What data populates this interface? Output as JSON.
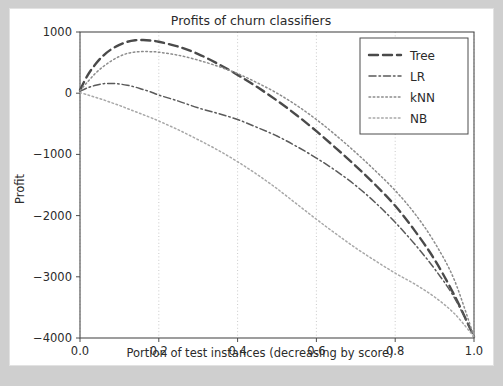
{
  "figure": {
    "background_color": "#ffffff",
    "page_background_color": "#cfcfcf"
  },
  "chart_data": {
    "type": "line",
    "title": "Profits of churn classifiers",
    "xlabel": "Portion of test instances (decreasing by score)",
    "ylabel": "Profit",
    "xlim": [
      0.0,
      1.0
    ],
    "ylim": [
      -4000,
      1000
    ],
    "xticks": [
      0.0,
      0.2,
      0.4,
      0.6,
      0.8,
      1.0
    ],
    "xticklabels": [
      "0.0",
      "0.2",
      "0.4",
      "0.6",
      "0.8",
      "1.0"
    ],
    "yticks": [
      1000,
      0,
      -1000,
      -2000,
      -3000,
      -4000
    ],
    "yticklabels": [
      "1000",
      "0",
      "-1000",
      "-2000",
      "-3000",
      "-4000"
    ],
    "grid": true,
    "grid_axis": "x",
    "legend_position": "upper right",
    "x": [
      0.0,
      0.02,
      0.04,
      0.06,
      0.08,
      0.1,
      0.12,
      0.14,
      0.16,
      0.18,
      0.2,
      0.25,
      0.3,
      0.35,
      0.4,
      0.45,
      0.5,
      0.55,
      0.6,
      0.65,
      0.7,
      0.75,
      0.8,
      0.85,
      0.9,
      0.95,
      1.0
    ],
    "series": [
      {
        "name": "Tree",
        "color": "#4a4a4a",
        "linestyle": "dashed",
        "linewidth": 2.4,
        "dasharray": "9 5",
        "values": [
          50,
          300,
          480,
          620,
          720,
          790,
          840,
          865,
          870,
          860,
          840,
          760,
          640,
          480,
          300,
          100,
          -120,
          -360,
          -620,
          -900,
          -1190,
          -1500,
          -1840,
          -2250,
          -2720,
          -3300,
          -3980
        ]
      },
      {
        "name": "LR",
        "color": "#5a5a5a",
        "linestyle": "dashdot",
        "linewidth": 1.5,
        "dasharray": "7 3 1.5 3",
        "values": [
          30,
          90,
          130,
          155,
          160,
          150,
          130,
          100,
          60,
          20,
          -30,
          -130,
          -240,
          -330,
          -430,
          -560,
          -700,
          -870,
          -1060,
          -1270,
          -1510,
          -1790,
          -2110,
          -2470,
          -2870,
          -3340,
          -3980
        ]
      },
      {
        "name": "kNN",
        "color": "#8c8c8c",
        "linestyle": "dotted",
        "linewidth": 1.5,
        "dasharray": "1.6 2.6",
        "values": [
          40,
          190,
          330,
          440,
          530,
          600,
          650,
          672,
          680,
          678,
          670,
          620,
          540,
          440,
          320,
          170,
          0,
          -200,
          -430,
          -690,
          -970,
          -1270,
          -1590,
          -1970,
          -2440,
          -3050,
          -3980
        ]
      },
      {
        "name": "NB",
        "color": "#a8a8a8",
        "linestyle": "dotted",
        "linewidth": 1.5,
        "dasharray": "1.6 2.6",
        "values": [
          10,
          -30,
          -70,
          -110,
          -155,
          -200,
          -250,
          -300,
          -350,
          -400,
          -455,
          -600,
          -760,
          -930,
          -1120,
          -1330,
          -1560,
          -1810,
          -2060,
          -2300,
          -2530,
          -2740,
          -2940,
          -3120,
          -3330,
          -3600,
          -3980
        ]
      }
    ]
  },
  "legend": {
    "entries": [
      {
        "label": "Tree"
      },
      {
        "label": "LR"
      },
      {
        "label": "kNN"
      },
      {
        "label": "NB"
      }
    ]
  }
}
